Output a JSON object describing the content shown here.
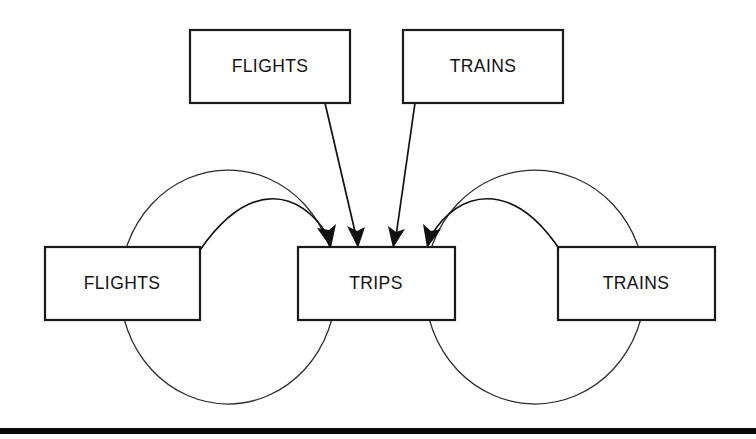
{
  "diagram": {
    "background_color": "#ffffff",
    "line_color": "#111111",
    "box_fill": "#ffffff",
    "box_stroke": "#1a1a1a",
    "ellipse_stroke": "#2a2a2a",
    "footer_bar_color": "#0a0a0a",
    "nodes": [
      {
        "id": "flights-top",
        "label": "FLIGHTS",
        "role": "subclass-entity",
        "x": 190,
        "y": 30,
        "w": 160,
        "h": 73,
        "cx": 270,
        "cy": 66
      },
      {
        "id": "trains-top",
        "label": "TRAINS",
        "role": "subclass-entity",
        "x": 403,
        "y": 30,
        "w": 160,
        "h": 73,
        "cx": 483,
        "cy": 66
      },
      {
        "id": "flights-left",
        "label": "FLIGHTS",
        "role": "relation-entity",
        "x": 45,
        "y": 247,
        "w": 155,
        "h": 73,
        "cx": 122,
        "cy": 283
      },
      {
        "id": "trips-center",
        "label": "TRIPS",
        "role": "superclass-entity",
        "x": 298,
        "y": 247,
        "w": 157,
        "h": 73,
        "cx": 376,
        "cy": 283
      },
      {
        "id": "trains-right",
        "label": "TRAINS",
        "role": "relation-entity",
        "x": 558,
        "y": 247,
        "w": 157,
        "h": 73,
        "cx": 636,
        "cy": 283
      }
    ],
    "ellipses": [
      {
        "id": "left-relationship-ellipse",
        "label": "",
        "cx": 228,
        "cy": 287,
        "rx": 108,
        "ry": 117
      },
      {
        "id": "right-relationship-ellipse",
        "label": "",
        "cx": 535,
        "cy": 287,
        "rx": 110,
        "ry": 117
      }
    ],
    "arrows": [
      {
        "id": "arrow-flights-left-to-trips",
        "kind": "curved",
        "from": "flights-left",
        "to": "trips-center",
        "path": "M 200 250 C 250 178 300 190 328 236",
        "tip_x": 331,
        "tip_y": 246,
        "tip_angle": 58
      },
      {
        "id": "arrow-flights-top-to-trips",
        "kind": "straight",
        "from": "flights-top",
        "to": "trips-center",
        "path": "M 325 103 L 356 236",
        "tip_x": 358,
        "tip_y": 246,
        "tip_angle": 77
      },
      {
        "id": "arrow-trains-top-to-trips",
        "kind": "straight",
        "from": "trains-top",
        "to": "trips-center",
        "path": "M 415 103 L 396 236",
        "tip_x": 394,
        "tip_y": 246,
        "tip_angle": 99
      },
      {
        "id": "arrow-trains-right-to-trips",
        "kind": "curved",
        "from": "trains-right",
        "to": "trips-center",
        "path": "M 560 250 C 512 178 458 190 431 236",
        "tip_x": 428,
        "tip_y": 246,
        "tip_angle": 122
      }
    ],
    "footer_bar": {
      "id": "page-footer-rule",
      "x": 0,
      "y": 428,
      "w": 756,
      "h": 6
    }
  }
}
